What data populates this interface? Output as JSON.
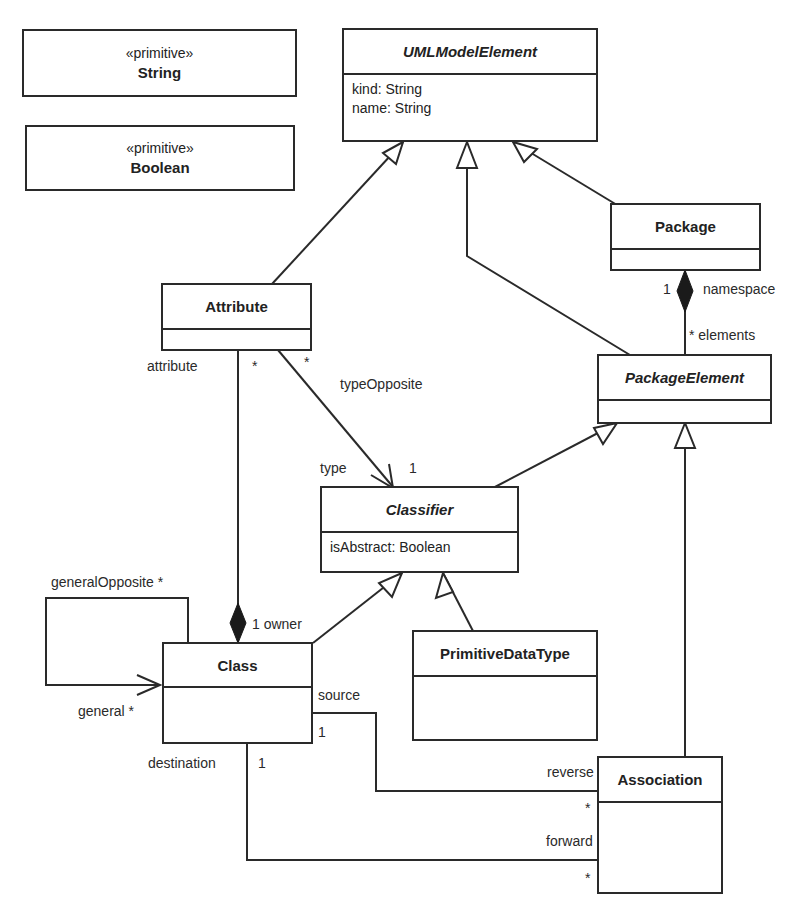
{
  "classes": {
    "string": {
      "stereotype": "«primitive»",
      "name": "String"
    },
    "boolean": {
      "stereotype": "«primitive»",
      "name": "Boolean"
    },
    "uml_model_element": {
      "name": "UMLModelElement",
      "abstract": true,
      "attributes": [
        "kind:  String",
        "name:  String"
      ]
    },
    "package": {
      "name": "Package"
    },
    "attribute": {
      "name": "Attribute"
    },
    "package_element": {
      "name": "PackageElement",
      "abstract": true
    },
    "classifier": {
      "name": "Classifier",
      "abstract": true,
      "attributes": [
        "isAbstract:  Boolean"
      ]
    },
    "class": {
      "name": "Class"
    },
    "primitive_data_type": {
      "name": "PrimitiveDataType"
    },
    "association": {
      "name": "Association"
    }
  },
  "labels": {
    "pkg_mult": "1",
    "namespace": "namespace",
    "elements": "* elements",
    "attribute_role": "attribute",
    "attr_star_left": "*",
    "attr_star_right": "*",
    "type_opposite": "typeOpposite",
    "type": "type",
    "type_mult": "1",
    "owner": "1 owner",
    "general_opposite": "generalOpposite *",
    "general": "general *",
    "source": "source",
    "source_mult": "1",
    "destination": "destination",
    "destination_mult": "1",
    "reverse": "reverse",
    "reverse_mult": "*",
    "forward": "forward",
    "forward_mult": "*"
  }
}
